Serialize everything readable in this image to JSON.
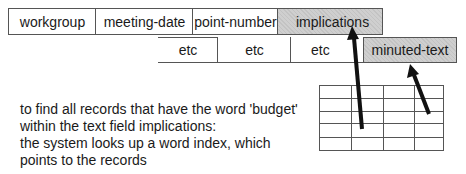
{
  "record_fields": {
    "row1": [
      "workgroup",
      "meeting-date",
      "point-number",
      "implications"
    ],
    "row2": [
      "etc",
      "etc",
      "etc",
      "minuted-text"
    ]
  },
  "highlighted_fields": [
    "implications",
    "minuted-text"
  ],
  "description": [
    "to find all records that have the word 'budget'",
    "within the text field implications:",
    "the system looks up a word index, which",
    "points to the records"
  ],
  "index_grid": {
    "rows": 5,
    "columns": 4
  },
  "colors": {
    "highlight": "#cfcfcf",
    "line": "#555555",
    "arrow": "#111111"
  }
}
